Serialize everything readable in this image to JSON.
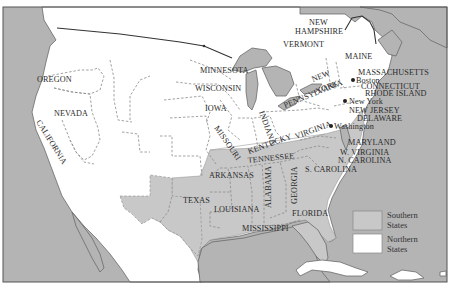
{
  "map": {
    "colors": {
      "water": "#b4b4b4",
      "southern_states": "#c8c8c8",
      "northern_states": "#ffffff",
      "other_land": "#ffffff",
      "frame": "#555555"
    },
    "states": {
      "oregon": "OREGON",
      "nevada": "NEVADA",
      "california": "CALIFORNIA",
      "minnesota": "MINNESOTA",
      "wisconsin": "WISCONSIN",
      "iowa": "IOWA",
      "missouri": "MISSOURI",
      "indiana": "INDIANA",
      "kentucky": "KENTUCKY",
      "virginia": "VIRGINIA",
      "tennessee": "TENNESSEE",
      "arkansas": "ARKANSAS",
      "texas": "TEXAS",
      "louisiana": "LOUISIANA",
      "mississippi": "MISSISSIPPI",
      "alabama": "ALABAMA",
      "georgia": "GEORGIA",
      "florida": "FLORIDA",
      "s_carolina": "S. CAROLINA",
      "n_carolina": "N. CAROLINA",
      "w_virginia": "W. VIRGINIA",
      "maryland": "MARYLAND",
      "delaware": "DELAWARE",
      "new_jersey": "NEW JERSEY",
      "pennsylvania": "PENNSYLVANIA",
      "new_york": "NEW YORK",
      "new_york_line1": "NEW",
      "new_york_line2": "YORK",
      "vermont": "VERMONT",
      "new_hampshire_line1": "NEW",
      "new_hampshire_line2": "HAMPSHIRE",
      "maine": "MAINE",
      "massachusetts": "MASSACHUSETTS",
      "connecticut": "CONNECTICUT",
      "rhode_island": "RHODE ISLAND"
    },
    "cities": {
      "boston": "Boston",
      "new_york": "New York",
      "washington": "Washington"
    },
    "legend": {
      "southern": {
        "line1": "Southern",
        "line2": "States",
        "color": "#c8c8c8"
      },
      "northern": {
        "line1": "Northern",
        "line2": "States",
        "color": "#ffffff"
      }
    }
  }
}
